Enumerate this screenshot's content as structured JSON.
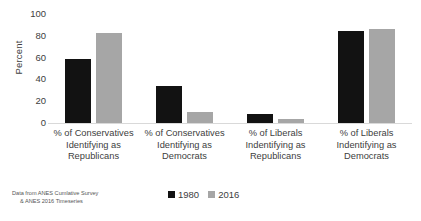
{
  "chart_data": {
    "type": "bar",
    "title": "",
    "subtitle": "",
    "xlabel": "",
    "ylabel": "Percent",
    "ylim": [
      0,
      100
    ],
    "yticks": [
      100,
      80,
      60,
      40,
      20,
      0
    ],
    "grid": false,
    "legend_position": "bottom-center",
    "categories": [
      "% of Conservatives Identifying as Republicans",
      "% of Conservatives Identifying as Democrats",
      "% of Liberals Indentifying as Republicans",
      "% of Liberals Indentifying as Democrats"
    ],
    "category_lines": [
      [
        "% of Conservatives",
        "Identifying as",
        "Republicans"
      ],
      [
        "% of Conservatives",
        "Identifying as",
        "Democrats"
      ],
      [
        "% of Liberals",
        "Indentifying as",
        "Republicans"
      ],
      [
        "% of Liberals",
        "Indentifying as",
        "Democrats"
      ]
    ],
    "series": [
      {
        "name": "1980",
        "color": "#121212",
        "values": [
          59,
          34,
          8,
          84
        ]
      },
      {
        "name": "2016",
        "color": "#a6a6a6",
        "values": [
          83,
          10,
          4,
          86
        ]
      }
    ],
    "annotation_lines": [
      "Data from ANES Cumlative Survey",
      "& ANES 2016 Timeseries"
    ]
  },
  "axis": {
    "y_title": "Percent"
  },
  "legend": {
    "items": [
      {
        "label": "1980"
      },
      {
        "label": "2016"
      }
    ]
  },
  "colors": {
    "series_1980": "#121212",
    "series_2016": "#a6a6a6",
    "axis_line": "#d9d9d9",
    "text": "#404040",
    "background": "#ffffff"
  }
}
